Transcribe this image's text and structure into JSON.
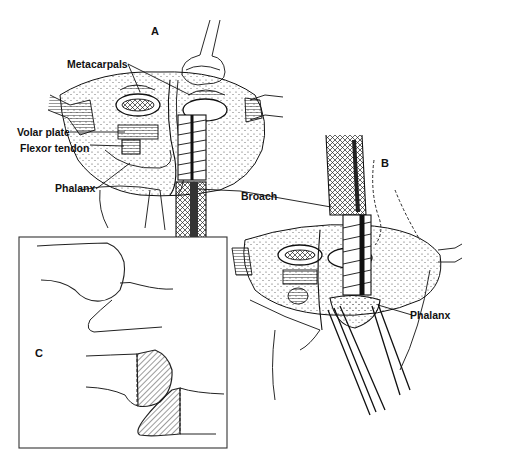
{
  "figure": {
    "type": "surgical-illustration",
    "panels": [
      {
        "id": "A",
        "letter": "A",
        "labels": {
          "metacarpals": "Metacarpals",
          "volar_plate": "Volar plate",
          "flexor_tendon": "Flexor tendon",
          "phalanx": "Phalanx",
          "broach": "Broach"
        }
      },
      {
        "id": "B",
        "letter": "B",
        "labels": {
          "phalanx": "Phalanx"
        }
      },
      {
        "id": "C",
        "letter": "C",
        "description": "Schematic of joint with hatched bone resection areas"
      }
    ]
  },
  "colors": {
    "ink": "#111111",
    "background": "#ffffff",
    "faded_text": "#d8d8d8"
  }
}
